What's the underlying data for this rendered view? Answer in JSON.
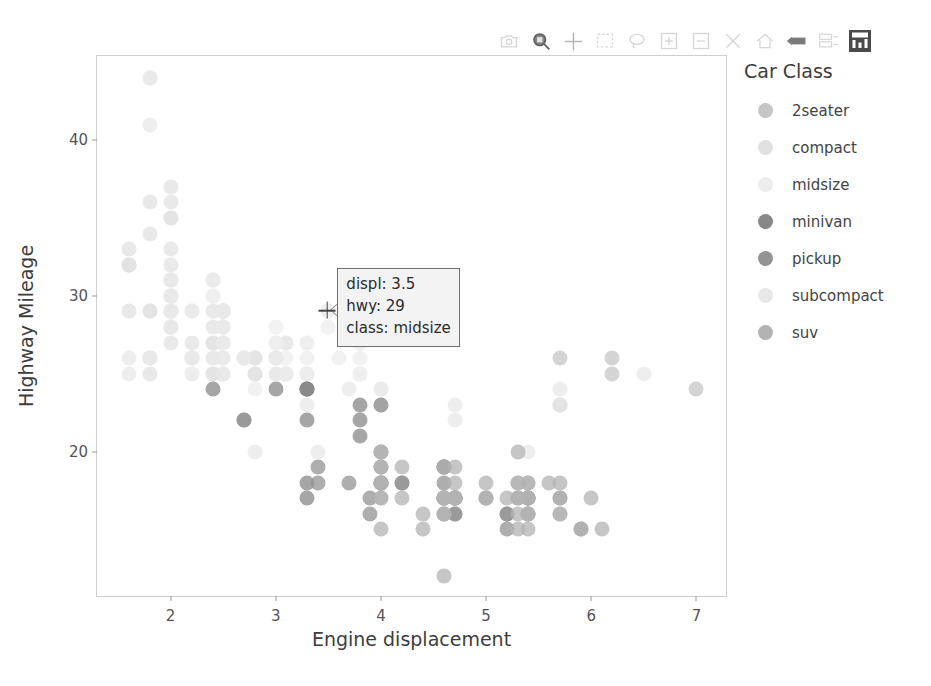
{
  "modebar": {
    "buttons": [
      {
        "name": "download-plot-icon",
        "label": "Download plot as a png",
        "style": "faint"
      },
      {
        "name": "zoom-icon",
        "label": "Zoom",
        "style": "strong"
      },
      {
        "name": "pan-icon",
        "label": "Pan",
        "style": "mid"
      },
      {
        "name": "box-select-icon",
        "label": "Box Select",
        "style": "faint"
      },
      {
        "name": "lasso-select-icon",
        "label": "Lasso Select",
        "style": "faint"
      },
      {
        "name": "zoom-in-icon",
        "label": "Zoom in",
        "style": "faint"
      },
      {
        "name": "zoom-out-icon",
        "label": "Zoom out",
        "style": "faint"
      },
      {
        "name": "autoscale-icon",
        "label": "Autoscale",
        "style": "faint"
      },
      {
        "name": "reset-axes-icon",
        "label": "Reset axes",
        "style": "faint"
      },
      {
        "name": "toggle-spike-lines-icon",
        "label": "Toggle Spike Lines",
        "style": "strong"
      },
      {
        "name": "hover-compare-icon",
        "label": "Show closest data on hover",
        "style": "faint"
      }
    ],
    "logo": {
      "name": "plotly-logo-icon",
      "label": "Produced with Plotly"
    }
  },
  "legend": {
    "title": "Car Class",
    "items": [
      {
        "label": "2seater",
        "color": "#c6c6c6"
      },
      {
        "label": "compact",
        "color": "#e1e1e1"
      },
      {
        "label": "midsize",
        "color": "#ededed"
      },
      {
        "label": "minivan",
        "color": "#888888"
      },
      {
        "label": "pickup",
        "color": "#939393"
      },
      {
        "label": "subcompact",
        "color": "#e8e8e8"
      },
      {
        "label": "suv",
        "color": "#b3b3b3"
      }
    ]
  },
  "hover": {
    "displ": "displ: 3.5",
    "hwy": "hwy: 29",
    "class": "class: midsize",
    "point_x": 3.5,
    "point_y": 29
  },
  "chart_data": {
    "type": "scatter",
    "title": "",
    "xlabel": "Engine displacement",
    "ylabel": "Highway Mileage",
    "xlim": [
      1.3,
      7.3
    ],
    "ylim": [
      10.6,
      45.4
    ],
    "xticks": [
      2,
      3,
      4,
      5,
      6,
      7
    ],
    "yticks": [
      20,
      30,
      40
    ],
    "grid": false,
    "legend_position": "right",
    "color_by": "class",
    "marker_size": 15,
    "marker_opacity": 0.75,
    "series": [
      {
        "name": "2seater",
        "color": "#c6c6c6",
        "points": [
          [
            5.7,
            26
          ],
          [
            5.7,
            23
          ],
          [
            6.2,
            26
          ],
          [
            6.2,
            25
          ],
          [
            7.0,
            24
          ]
        ]
      },
      {
        "name": "compact",
        "color": "#e1e1e1",
        "points": [
          [
            1.8,
            29
          ],
          [
            1.8,
            29
          ],
          [
            2.0,
            31
          ],
          [
            2.0,
            30
          ],
          [
            2.8,
            26
          ],
          [
            2.8,
            26
          ],
          [
            3.1,
            27
          ],
          [
            1.8,
            26
          ],
          [
            1.8,
            25
          ],
          [
            2.0,
            28
          ],
          [
            2.0,
            27
          ],
          [
            2.8,
            25
          ],
          [
            2.8,
            25
          ],
          [
            3.1,
            25
          ],
          [
            3.1,
            25
          ],
          [
            2.4,
            27
          ],
          [
            2.4,
            25
          ],
          [
            2.5,
            27
          ],
          [
            2.5,
            25
          ],
          [
            3.3,
            25
          ],
          [
            2.0,
            33
          ],
          [
            2.0,
            35
          ],
          [
            2.0,
            37
          ],
          [
            2.0,
            35
          ],
          [
            2.5,
            29
          ],
          [
            2.5,
            29
          ],
          [
            2.5,
            29
          ],
          [
            2.5,
            29
          ],
          [
            2.5,
            28
          ],
          [
            2.5,
            29
          ],
          [
            2.2,
            26
          ],
          [
            2.2,
            27
          ],
          [
            2.4,
            26
          ],
          [
            2.4,
            25
          ],
          [
            2.4,
            28
          ],
          [
            2.4,
            27
          ],
          [
            3.0,
            26
          ],
          [
            3.0,
            25
          ],
          [
            3.3,
            24
          ],
          [
            1.6,
            33
          ],
          [
            1.6,
            32
          ],
          [
            1.6,
            32
          ],
          [
            1.6,
            29
          ],
          [
            1.6,
            32
          ],
          [
            1.8,
            34
          ],
          [
            1.8,
            36
          ],
          [
            2.0,
            36
          ]
        ]
      },
      {
        "name": "midsize",
        "color": "#ededed",
        "points": [
          [
            2.4,
            31
          ],
          [
            3.0,
            26
          ],
          [
            3.3,
            27
          ],
          [
            2.4,
            29
          ],
          [
            3.0,
            27
          ],
          [
            3.3,
            26
          ],
          [
            2.5,
            28
          ],
          [
            3.0,
            27
          ],
          [
            2.4,
            31
          ],
          [
            3.0,
            28
          ],
          [
            3.5,
            29
          ],
          [
            2.4,
            30
          ],
          [
            3.0,
            26
          ],
          [
            3.5,
            28
          ],
          [
            3.8,
            27
          ],
          [
            2.5,
            27
          ],
          [
            2.5,
            28
          ],
          [
            3.3,
            27
          ],
          [
            3.8,
            27
          ],
          [
            3.8,
            26
          ],
          [
            3.8,
            25
          ],
          [
            3.8,
            28
          ],
          [
            4.0,
            24
          ],
          [
            2.4,
            30
          ],
          [
            2.4,
            29
          ],
          [
            2.5,
            29
          ],
          [
            3.5,
            29
          ],
          [
            3.5,
            29
          ],
          [
            3.0,
            26
          ],
          [
            3.0,
            26
          ],
          [
            3.1,
            26
          ],
          [
            3.3,
            25
          ],
          [
            3.8,
            25
          ],
          [
            4.0,
            23
          ],
          [
            2.8,
            24
          ],
          [
            3.1,
            25
          ],
          [
            3.6,
            26
          ]
        ]
      },
      {
        "name": "minivan",
        "color": "#888888",
        "points": [
          [
            2.4,
            24
          ],
          [
            3.0,
            24
          ],
          [
            3.3,
            24
          ],
          [
            3.3,
            22
          ],
          [
            3.3,
            24
          ],
          [
            3.3,
            24
          ],
          [
            3.3,
            17
          ],
          [
            3.8,
            22
          ],
          [
            3.8,
            21
          ],
          [
            3.8,
            23
          ],
          [
            4.0,
            23
          ],
          [
            3.3,
            18
          ]
        ]
      },
      {
        "name": "pickup",
        "color": "#939393",
        "points": [
          [
            2.7,
            22
          ],
          [
            2.7,
            22
          ],
          [
            3.4,
            19
          ],
          [
            3.4,
            18
          ],
          [
            4.0,
            18
          ],
          [
            4.7,
            17
          ],
          [
            4.7,
            16
          ],
          [
            4.7,
            17
          ],
          [
            5.2,
            16
          ],
          [
            5.2,
            16
          ],
          [
            3.9,
            17
          ],
          [
            3.9,
            16
          ],
          [
            4.7,
            17
          ],
          [
            4.7,
            16
          ],
          [
            4.7,
            17
          ],
          [
            5.2,
            15
          ],
          [
            5.7,
            17
          ],
          [
            5.9,
            15
          ],
          [
            4.6,
            17
          ],
          [
            5.4,
            17
          ],
          [
            5.4,
            16
          ],
          [
            4.0,
            18
          ],
          [
            4.0,
            18
          ],
          [
            4.6,
            18
          ],
          [
            5.0,
            17
          ],
          [
            4.2,
            18
          ],
          [
            4.2,
            18
          ],
          [
            4.6,
            19
          ],
          [
            4.6,
            19
          ],
          [
            4.6,
            19
          ],
          [
            5.4,
            17
          ],
          [
            5.4,
            17
          ],
          [
            3.7,
            18
          ]
        ]
      },
      {
        "name": "subcompact",
        "color": "#e8e8e8",
        "points": [
          [
            2.2,
            29
          ],
          [
            2.2,
            29
          ],
          [
            2.4,
            31
          ],
          [
            2.4,
            29
          ],
          [
            2.5,
            28
          ],
          [
            2.5,
            29
          ],
          [
            3.3,
            23
          ],
          [
            2.0,
            29
          ],
          [
            2.0,
            29
          ],
          [
            2.0,
            28
          ],
          [
            2.0,
            29
          ],
          [
            2.7,
            26
          ],
          [
            2.7,
            26
          ],
          [
            2.7,
            26
          ],
          [
            3.0,
            26
          ],
          [
            3.7,
            24
          ],
          [
            4.0,
            24
          ],
          [
            4.7,
            22
          ],
          [
            4.7,
            23
          ],
          [
            5.7,
            23
          ],
          [
            5.7,
            24
          ],
          [
            6.5,
            25
          ],
          [
            2.0,
            31
          ],
          [
            2.0,
            30
          ],
          [
            2.2,
            26
          ],
          [
            2.5,
            27
          ],
          [
            2.5,
            26
          ],
          [
            2.5,
            29
          ],
          [
            2.5,
            26
          ],
          [
            2.5,
            25
          ],
          [
            2.8,
            20
          ],
          [
            3.4,
            20
          ],
          [
            1.6,
            26
          ],
          [
            1.6,
            25
          ],
          [
            1.8,
            44
          ],
          [
            1.8,
            41
          ],
          [
            1.8,
            44
          ],
          [
            1.8,
            26
          ],
          [
            1.8,
            26
          ],
          [
            2.0,
            29
          ],
          [
            2.0,
            28
          ],
          [
            2.0,
            32
          ],
          [
            2.0,
            32
          ],
          [
            2.2,
            25
          ],
          [
            2.2,
            26
          ],
          [
            5.4,
            20
          ]
        ]
      },
      {
        "name": "suv",
        "color": "#b3b3b3",
        "points": [
          [
            4.0,
            15
          ],
          [
            4.0,
            20
          ],
          [
            4.0,
            18
          ],
          [
            4.6,
            17
          ],
          [
            5.0,
            17
          ],
          [
            4.2,
            17
          ],
          [
            4.4,
            15
          ],
          [
            4.6,
            17
          ],
          [
            5.4,
            15
          ],
          [
            5.4,
            17
          ],
          [
            4.0,
            17
          ],
          [
            4.0,
            19
          ],
          [
            4.6,
            19
          ],
          [
            5.0,
            17
          ],
          [
            4.6,
            17
          ],
          [
            4.6,
            17
          ],
          [
            5.4,
            16
          ],
          [
            5.4,
            16
          ],
          [
            4.0,
            20
          ],
          [
            4.0,
            20
          ],
          [
            4.7,
            17
          ],
          [
            4.7,
            17
          ],
          [
            4.7,
            17
          ],
          [
            5.2,
            17
          ],
          [
            5.7,
            17
          ],
          [
            5.9,
            15
          ],
          [
            4.6,
            16
          ],
          [
            5.4,
            16
          ],
          [
            5.4,
            17
          ],
          [
            4.0,
            18
          ],
          [
            4.0,
            19
          ],
          [
            4.0,
            19
          ],
          [
            4.6,
            16
          ],
          [
            4.6,
            16
          ],
          [
            4.6,
            17
          ],
          [
            4.6,
            17
          ],
          [
            4.6,
            12
          ],
          [
            5.4,
            18
          ],
          [
            5.4,
            18
          ],
          [
            6.1,
            15
          ],
          [
            4.0,
            17
          ],
          [
            4.2,
            19
          ],
          [
            4.4,
            16
          ],
          [
            4.6,
            17
          ],
          [
            5.3,
            17
          ],
          [
            5.3,
            18
          ],
          [
            5.3,
            17
          ],
          [
            5.7,
            16
          ],
          [
            5.7,
            16
          ],
          [
            6.0,
            17
          ],
          [
            5.3,
            20
          ],
          [
            5.3,
            18
          ],
          [
            5.3,
            17
          ],
          [
            5.7,
            18
          ],
          [
            5.6,
            18
          ],
          [
            5.3,
            16
          ],
          [
            5.3,
            15
          ],
          [
            4.7,
            17
          ],
          [
            4.7,
            18
          ],
          [
            4.7,
            19
          ],
          [
            5.0,
            18
          ]
        ]
      }
    ]
  }
}
